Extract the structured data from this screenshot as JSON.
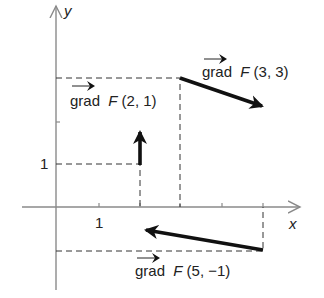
{
  "figure": {
    "axes": {
      "x_label": "x",
      "y_label": "y",
      "x_tick_label": "1",
      "y_tick_label": "1"
    },
    "vectors": [
      {
        "label_prefix": "grad",
        "label_fn": "F",
        "label_args": "(2, 1)",
        "point": [
          2,
          1
        ],
        "direction": [
          0,
          0.8
        ]
      },
      {
        "label_prefix": "grad",
        "label_fn": "F",
        "label_args": "(3, 3)",
        "point": [
          3,
          3
        ],
        "direction": [
          2.1,
          -0.75
        ]
      },
      {
        "label_prefix": "grad",
        "label_fn": "F",
        "label_args": "(5, −1)",
        "point": [
          5,
          -1
        ],
        "direction": [
          -3,
          0.5
        ]
      }
    ],
    "colors": {
      "axis": "#8a8a8a",
      "vector": "#111111",
      "guide": "#333333"
    }
  }
}
